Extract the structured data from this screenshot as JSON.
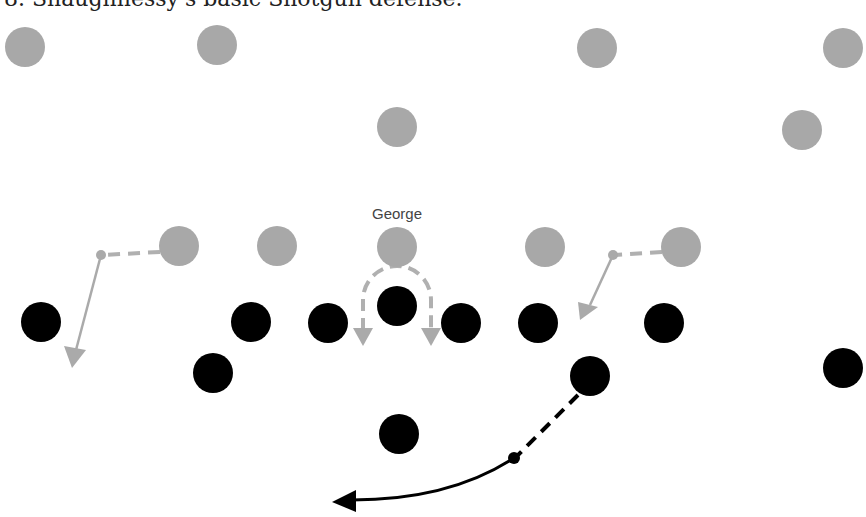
{
  "caption": "8. Shaughnessy's basic Shotgun defense.",
  "colors": {
    "defense": "#a8a8a8",
    "offense": "#000000",
    "defense_route": "#b0b0b0",
    "offense_route": "#000000"
  },
  "label": {
    "text": "George",
    "x": 397,
    "y": 219
  },
  "player_radius": 20,
  "defense": [
    {
      "x": 25,
      "y": 47
    },
    {
      "x": 217,
      "y": 45
    },
    {
      "x": 597,
      "y": 48
    },
    {
      "x": 843,
      "y": 48
    },
    {
      "x": 397,
      "y": 127
    },
    {
      "x": 802,
      "y": 130
    },
    {
      "x": 179,
      "y": 246
    },
    {
      "x": 277,
      "y": 246
    },
    {
      "x": 397,
      "y": 247,
      "name": "George"
    },
    {
      "x": 545,
      "y": 247
    },
    {
      "x": 681,
      "y": 247
    }
  ],
  "offense": [
    {
      "x": 41,
      "y": 322
    },
    {
      "x": 251,
      "y": 322
    },
    {
      "x": 328,
      "y": 323
    },
    {
      "x": 397,
      "y": 306
    },
    {
      "x": 461,
      "y": 323
    },
    {
      "x": 538,
      "y": 323
    },
    {
      "x": 664,
      "y": 323
    },
    {
      "x": 213,
      "y": 373
    },
    {
      "x": 590,
      "y": 376
    },
    {
      "x": 843,
      "y": 368
    },
    {
      "x": 399,
      "y": 434
    }
  ]
}
